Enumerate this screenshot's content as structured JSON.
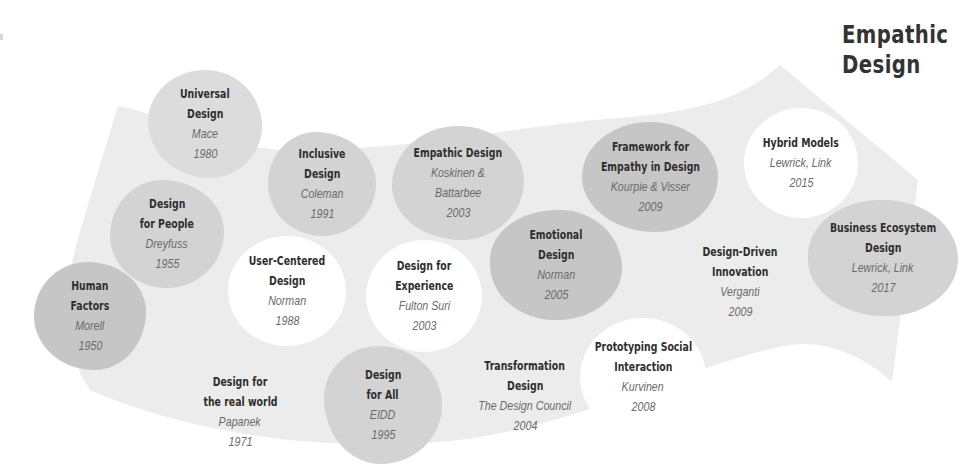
{
  "title": {
    "line1": "Empathic",
    "line2": "Design"
  },
  "colors": {
    "band": "#ececec",
    "blob_dark": "#c6c6c6",
    "blob_mid": "#d3d3d3",
    "blob_light": "#dcdcdc",
    "blob_white": "#ffffff",
    "heading_text": "#2e2e2e",
    "author_text": "#6a6a6a"
  },
  "milestones": [
    {
      "name1": "Human",
      "name2": "Factors",
      "author": "Morell",
      "year": "1950",
      "shade": "dark"
    },
    {
      "name1": "Design",
      "name2": "for People",
      "author": "Dreyfuss",
      "year": "1955",
      "shade": "mid"
    },
    {
      "name1": "Design for",
      "name2": "the real world",
      "author": "Papanek",
      "year": "1971",
      "shade": "none"
    },
    {
      "name1": "Universal",
      "name2": "Design",
      "author": "Mace",
      "year": "1980",
      "shade": "light"
    },
    {
      "name1": "User-Centered",
      "name2": "Design",
      "author": "Norman",
      "year": "1988",
      "shade": "white"
    },
    {
      "name1": "Inclusive",
      "name2": "Design",
      "author": "Coleman",
      "year": "1991",
      "shade": "mid"
    },
    {
      "name1": "Design",
      "name2": "for All",
      "author": "EIDD",
      "year": "1995",
      "shade": "mid"
    },
    {
      "name1": "Empathic Design",
      "name2": "",
      "author": "Koskinen &",
      "author2": "Battarbee",
      "year": "2003",
      "shade": "mid"
    },
    {
      "name1": "Design for",
      "name2": "Experience",
      "author": "Fulton Suri",
      "year": "2003",
      "shade": "white"
    },
    {
      "name1": "Transformation",
      "name2": "Design",
      "author": "The Design Council",
      "year": "2004",
      "shade": "none"
    },
    {
      "name1": "Emotional",
      "name2": "Design",
      "author": "Norman",
      "year": "2005",
      "shade": "dark"
    },
    {
      "name1": "Prototyping Social",
      "name2": "Interaction",
      "author": "Kurvinen",
      "year": "2008",
      "shade": "white"
    },
    {
      "name1": "Framework for",
      "name2": "Empathy in Design",
      "author": "Kourpie & Visser",
      "year": "2009",
      "shade": "dark"
    },
    {
      "name1": "Design-Driven",
      "name2": "Innovation",
      "author": "Verganti",
      "year": "2009",
      "shade": "none"
    },
    {
      "name1": "Hybrid Models",
      "name2": "",
      "author": "Lewrick, Link",
      "year": "2015",
      "shade": "white"
    },
    {
      "name1": "Business Ecosystem",
      "name2": "Design",
      "author": "Lewrick, Link",
      "year": "2017",
      "shade": "mid"
    }
  ]
}
